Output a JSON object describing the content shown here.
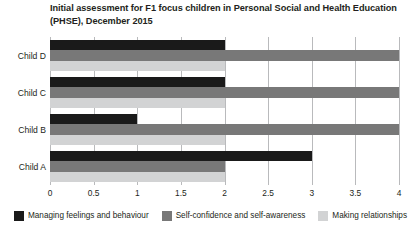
{
  "chart_data": {
    "type": "bar",
    "orientation": "horizontal",
    "title": "Initial assessment for F1 focus children in Personal Social and Health Education (PHSE), December 2015",
    "xlabel": "",
    "ylabel": "",
    "xlim": [
      0,
      4
    ],
    "ylim": null,
    "grid": true,
    "grid_axis": "x",
    "legend_position": "bottom",
    "categories": [
      "Child A",
      "Child B",
      "Child C",
      "Child D"
    ],
    "category_order_top_to_bottom": [
      "Child D",
      "Child C",
      "Child B",
      "Child A"
    ],
    "xticks": [
      0,
      0.5,
      1,
      1.5,
      2,
      2.5,
      3,
      3.5,
      4
    ],
    "xtick_labels": [
      "0",
      "0.5",
      "1",
      "1.5",
      "2",
      "2.5",
      "3",
      "3.5",
      "4"
    ],
    "series": [
      {
        "name": "Managing feelings and behaviour",
        "color": "#1a1a1a",
        "values": [
          3,
          1,
          2,
          2
        ]
      },
      {
        "name": "Self-confidence and self-awareness",
        "color": "#787878",
        "values": [
          2,
          4,
          4,
          4
        ]
      },
      {
        "name": "Making relationships",
        "color": "#d2d3d4",
        "values": [
          2,
          2,
          2,
          2
        ]
      }
    ]
  },
  "title": {
    "line1": "Initial assessment for F1 focus children in Personal Social and Health",
    "line2": "Education (PHSE), December 2015"
  },
  "axis": {
    "ticks": [
      "0",
      "0.5",
      "1",
      "1.5",
      "2",
      "2.5",
      "3",
      "3.5",
      "4"
    ]
  },
  "categories": [
    "Child D",
    "Child C",
    "Child B",
    "Child A"
  ],
  "legend": {
    "items": [
      {
        "label": "Managing feelings and behaviour",
        "color": "#1a1a1a"
      },
      {
        "label": "Self-confidence and self-awareness",
        "color": "#787878"
      },
      {
        "label": "Making relationships",
        "color": "#d2d3d4"
      }
    ]
  },
  "colors": {
    "series_1": "#1a1a1a",
    "series_2": "#787878",
    "series_3": "#d2d3d4",
    "gridline": "#b9babc",
    "text": "#231f20",
    "background": "#ffffff"
  }
}
